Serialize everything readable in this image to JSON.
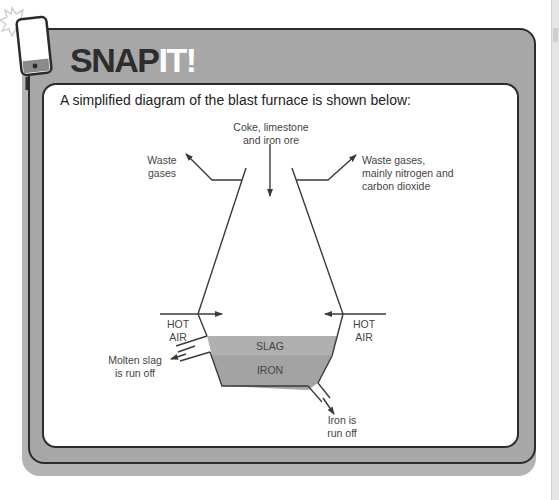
{
  "header": {
    "title_part1": "SNAP",
    "title_part2": "IT!",
    "icon": "phone-flash-icon"
  },
  "intro_text": "A simplified diagram of the blast furnace is shown below:",
  "diagram": {
    "labels": {
      "inputs_line1": "Coke, limestone",
      "inputs_line2": "and iron ore",
      "waste_left_line1": "Waste",
      "waste_left_line2": "gases",
      "waste_right_line1": "Waste gases,",
      "waste_right_line2": "mainly nitrogen and",
      "waste_right_line3": "carbon dioxide",
      "hot_air_left_line1": "HOT",
      "hot_air_left_line2": "AIR",
      "hot_air_right_line1": "HOT",
      "hot_air_right_line2": "AIR",
      "slag": "SLAG",
      "iron": "IRON",
      "slag_out_line1": "Molten slag",
      "slag_out_line2": "is run off",
      "iron_out_line1": "Iron is",
      "iron_out_line2": "run off"
    },
    "colors": {
      "line": "#3a3a3a",
      "slag_fill": "#b0b0b0",
      "iron_fill": "#a3a3a3",
      "card_fill": "#a7a7a7",
      "title_dark": "#2d2d2d",
      "title_light": "#ffffff"
    }
  }
}
